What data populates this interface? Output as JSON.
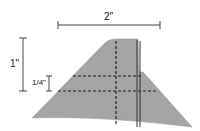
{
  "diagram": {
    "dimensions": {
      "width_label": "2\"",
      "height_label": "1\"",
      "offset_label": "1/4\""
    },
    "colors": {
      "shape_fill": "#a5a5a5",
      "line": "#333333",
      "background": "#ffffff"
    }
  }
}
